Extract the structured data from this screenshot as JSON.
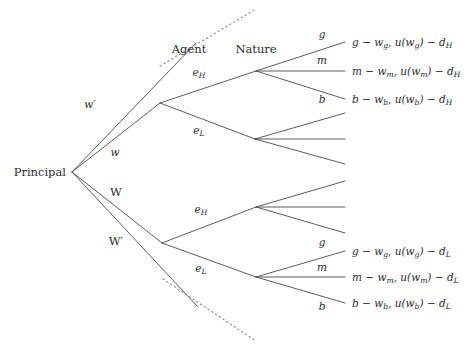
{
  "figure": {
    "type": "game-tree",
    "background_color": "#ffffff",
    "line_color": "#4a4a4a",
    "infoset_color": "#8d8d8d",
    "text_color": "#2b2b2b"
  },
  "players": {
    "principal": "Principal",
    "agent": "Agent",
    "nature": "Nature"
  },
  "principal_actions": [
    {
      "label": "w′",
      "style": "italic"
    },
    {
      "label": "w",
      "style": "italic"
    },
    {
      "label": "W",
      "style": "roman"
    },
    {
      "label": "W′",
      "style": "roman"
    }
  ],
  "agent_actions": {
    "high_effort": {
      "base": "e",
      "sub": "H"
    },
    "low_effort": {
      "base": "e",
      "sub": "L"
    }
  },
  "nature_outcomes": [
    {
      "label": "g"
    },
    {
      "label": "m"
    },
    {
      "label": "b"
    }
  ],
  "payoffs": {
    "top_branch_d": "H",
    "bottom_branch_d": "L",
    "rows": [
      {
        "id": "good-high",
        "parts": [
          "g",
          " − ",
          "w",
          "g",
          ", ",
          "u",
          "(",
          "w",
          "g",
          ")",
          " − ",
          "d",
          "H"
        ]
      },
      {
        "id": "medium-high",
        "parts": [
          "m",
          " − ",
          "w",
          "m",
          ", ",
          "u",
          "(",
          "w",
          "m",
          ")",
          " − ",
          "d",
          "H"
        ]
      },
      {
        "id": "bad-high",
        "parts": [
          "b",
          " − ",
          "w",
          "b",
          ", ",
          "u",
          "(",
          "w",
          "b",
          ")",
          " − ",
          "d",
          "H"
        ]
      }
    ],
    "top": [
      {
        "id": "good-high",
        "main": "g − w",
        "msub": "g",
        "mid": ", u(w",
        "midsub": "g",
        "tail": ") − d",
        "tailsub": "H"
      },
      {
        "id": "medium-high",
        "main": "m − w",
        "msub": "m",
        "mid": ", u(w",
        "midsub": "m",
        "tail": ") − d",
        "tailsub": "H"
      },
      {
        "id": "bad-high",
        "main": "b − w",
        "msub": "b",
        "mid": ", u(w",
        "midsub": "b",
        "tail": ") − d",
        "tailsub": "H"
      }
    ],
    "bottom": [
      {
        "id": "good-low",
        "main": "g − w",
        "msub": "g",
        "mid": ", u(w",
        "midsub": "g",
        "tail": ") − d",
        "tailsub": "L"
      },
      {
        "id": "medium-low",
        "main": "m − w",
        "msub": "m",
        "mid": ", u(w",
        "midsub": "m",
        "tail": ") − d",
        "tailsub": "L"
      },
      {
        "id": "bad-low",
        "main": "b − w",
        "msub": "b",
        "mid": ", u(w",
        "midsub": "b",
        "tail": ") − d",
        "tailsub": "L"
      }
    ]
  },
  "geometry": {
    "root": {
      "x": 72,
      "y": 172
    },
    "agent_nodes": [
      {
        "id": "agent-upper",
        "x": 160,
        "y": 103
      },
      {
        "id": "agent-lower",
        "x": 162,
        "y": 243
      }
    ],
    "nature_nodes": [
      {
        "id": "nature-1",
        "x": 256,
        "y": 71,
        "labeled": true
      },
      {
        "id": "nature-2",
        "x": 255,
        "y": 139,
        "labeled": false
      },
      {
        "id": "nature-3",
        "x": 256,
        "y": 207,
        "labeled": false
      },
      {
        "id": "nature-4",
        "x": 256,
        "y": 277,
        "labeled": true
      }
    ],
    "terminal_x": 345,
    "payoff_text_x": 352,
    "infoset_upper": {
      "x1": 160,
      "y1": 66,
      "x2": 256,
      "y2": 9
    },
    "infoset_lower": {
      "x1": 163,
      "y1": 279,
      "x2": 256,
      "y2": 341
    }
  }
}
